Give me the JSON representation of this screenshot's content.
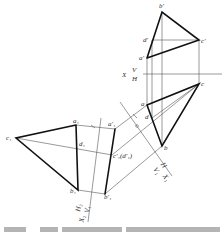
{
  "figure": {
    "type": "descriptive-geometry projection (change of projection planes)",
    "width": 224,
    "height": 232
  },
  "points": {
    "b_prime": {
      "label": "b'",
      "x": 162,
      "y": 12
    },
    "d_prime": {
      "label": "d'",
      "x": 152,
      "y": 40
    },
    "c_prime": {
      "label": "c'",
      "x": 199,
      "y": 40
    },
    "a_prime": {
      "label": "a'",
      "x": 147,
      "y": 58
    },
    "c": {
      "label": "c",
      "x": 199,
      "y": 84
    },
    "a": {
      "label": "a",
      "x": 147,
      "y": 105
    },
    "d": {
      "label": "d",
      "x": 152,
      "y": 118
    },
    "b": {
      "label": "b",
      "x": 162,
      "y": 146
    },
    "a1": {
      "label": "a₁",
      "x": 76,
      "y": 125
    },
    "d1": {
      "label": "d₁",
      "x": 77,
      "y": 148
    },
    "c1": {
      "label": "c₁",
      "x": 16,
      "y": 138
    },
    "b1": {
      "label": "b₁",
      "x": 78,
      "y": 190
    },
    "a1_prime": {
      "label": "a'₁",
      "x": 115,
      "y": 129
    },
    "c1_prime": {
      "label": "c'₁(d'₁)",
      "x": 112,
      "y": 155
    },
    "b1_prime": {
      "label": "b'₁",
      "x": 105,
      "y": 194
    }
  },
  "axes": {
    "x_vh": {
      "label_x": "X",
      "label_top": "V",
      "label_bottom": "H",
      "x1": 143,
      "y1": 74,
      "x2": 222,
      "y2": 74
    },
    "x_hv1": {
      "label_top": "H",
      "label_bottom": "V₁",
      "label_x": "X₁",
      "x1": 120,
      "y1": 102,
      "x2": 172,
      "y2": 176
    },
    "x_v1h2": {
      "label_top": "H₂",
      "label_bottom": "V₁",
      "label_x": "X₂",
      "x1": 101,
      "y1": 118,
      "x2": 88,
      "y2": 222
    }
  },
  "caption": {
    "visible": "partial (cut off at bottom edge, illegible)"
  }
}
